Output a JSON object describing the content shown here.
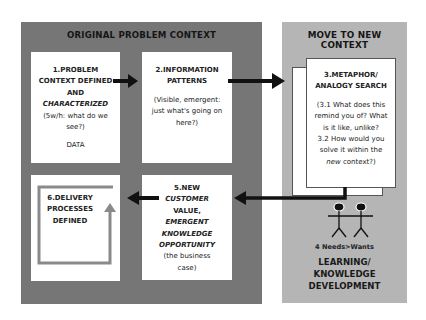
{
  "left_panel": {
    "title": "ORIGINAL PROBLEM CONTEXT",
    "color": "#767676"
  },
  "right_panel": {
    "title_line1": "MOVE TO NEW",
    "title_line2": "CONTEXT",
    "color": "#b5b5b5"
  },
  "boxes": {
    "box1": {
      "title_line1": "1.PROBLEM",
      "title_line2": "CONTEXT DEFINED",
      "title_line3": "AND",
      "title_line4": "CHARACTERIZED",
      "sub_line1": "(5w/h: what do we",
      "sub_line2": "see?)",
      "footer": "DATA"
    },
    "box2": {
      "title_line1": "2.INFORMATION",
      "title_line2": "PATTERNS",
      "sub_line1": "(Visible, emergent:",
      "sub_line2": "just what's going on",
      "sub_line3": "here?)"
    },
    "box3": {
      "title_line1": "3.METAPHOR/",
      "title_line2": "ANALOGY SEARCH",
      "sub_line1": "(3.1 What does this",
      "sub_line2": "remind you of? What",
      "sub_line3": "is it like, unlike?",
      "sub_line4": "3.2 How would you",
      "sub_line5": "solve it within the",
      "sub_line6_italic": "new",
      "sub_line6_rest": " context?)"
    },
    "box4": {
      "label": "4 Needs>Wants",
      "footer_line1": "LEARNING/",
      "footer_line2": "KNOWLEDGE",
      "footer_line3": "DEVELOPMENT"
    },
    "box5": {
      "title_line1": "5.NEW",
      "title_line2": "CUSTOMER",
      "title_line3": "VALUE,",
      "italic_line1": "EMERGENT",
      "italic_line2": "KNOWLEDGE",
      "italic_line3": "OPPORTUNITY",
      "sub_line1": "(the business",
      "sub_line2": "case)"
    },
    "box6": {
      "title_line1": "6.DELIVERY",
      "title_line2": "PROCESSES",
      "title_line3": "DEFINED"
    }
  },
  "icons": {
    "arrow_color": "#111111",
    "loop_arrow_color": "#8a8a8a",
    "people": "stick-figures-icon"
  }
}
